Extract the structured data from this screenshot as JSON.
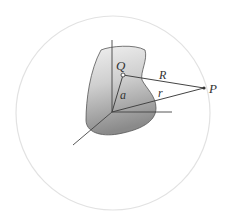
{
  "diagram": {
    "type": "vector-geometry-figure",
    "labels": {
      "source_point": "Q",
      "field_point": "P",
      "separation": "R",
      "field_position": "r",
      "source_position": "a"
    },
    "colors": {
      "sphere_outline": "#e2e2e2",
      "region_fill_light": "#e6e6e6",
      "region_fill_dark": "#8f8f8f",
      "region_outline": "#555555",
      "lines": "#444444",
      "text": "#333333"
    },
    "points": {
      "origin": [
        112,
        112
      ],
      "Q": [
        123,
        75
      ],
      "P": [
        204,
        88
      ]
    },
    "sphere": {
      "cx": 113,
      "cy": 113,
      "r": 97
    }
  }
}
